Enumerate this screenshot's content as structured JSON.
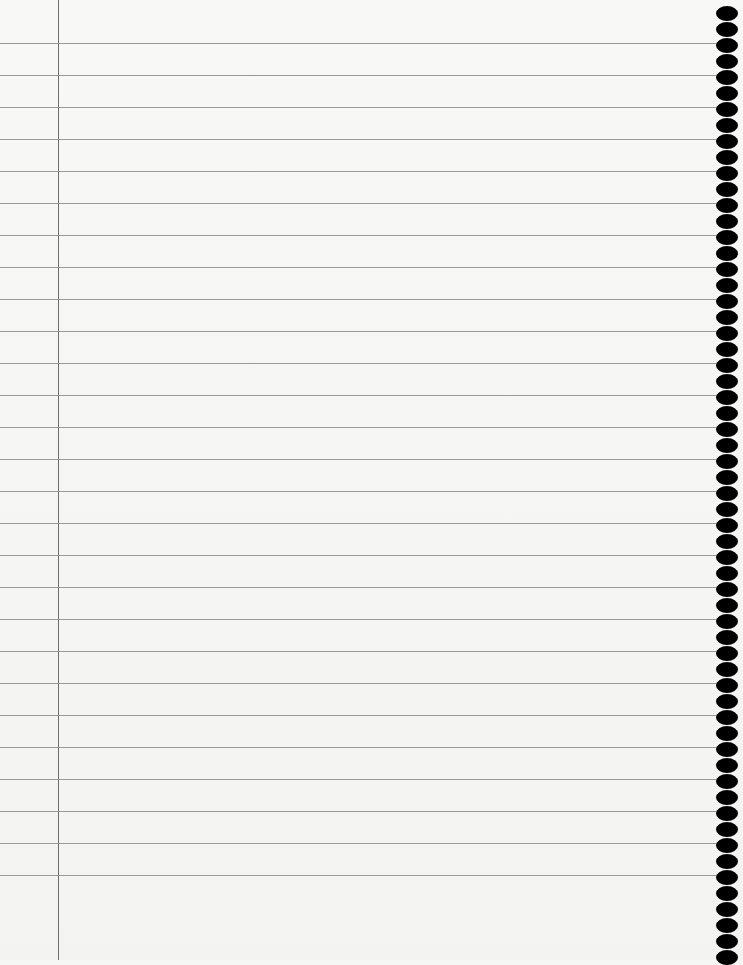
{
  "page": {
    "type": "lined-notebook-paper",
    "background_color": "#f6f6f5",
    "rule_color": "#8a8a8a",
    "margin_color": "#6e6e6e",
    "hole_color": "#000000"
  },
  "rules": {
    "first_y": 43,
    "spacing": 32,
    "count": 27
  },
  "margin": {
    "x": 58
  },
  "binding_holes": {
    "center_x": 727,
    "first_y": 13,
    "spacing": 16,
    "count": 60
  }
}
